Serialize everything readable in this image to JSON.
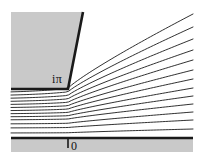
{
  "figure": {
    "name": "complex-strip-streamlines",
    "width": 204,
    "height": 162,
    "background": "#ffffff",
    "region_fill": "#c9c9c9",
    "stroke_color": "#1a1a1a",
    "thick_stroke_width": 2.6,
    "thin_stroke_width": 0.9
  },
  "labels": {
    "upper_boundary": "iπ",
    "lower_boundary": "0"
  },
  "geometry": {
    "panel": {
      "x": 11,
      "y": 12,
      "width": 182,
      "height": 140
    },
    "corner": {
      "x": 68,
      "y": 89
    },
    "upper_line_y": 89,
    "lower_line_y": 138,
    "wedge_angle_deg": 45,
    "tick": {
      "x": 68,
      "y_top": 138,
      "y_bottom": 148
    }
  },
  "chart_data": {
    "type": "line",
    "title": "",
    "xlabel": "",
    "ylabel": "",
    "boundaries": [
      {
        "name": "upper-boundary",
        "label": "iπ",
        "y_left": 89,
        "corner_x": 68,
        "slope_deg": 45
      },
      {
        "name": "lower-boundary",
        "label": "0",
        "y_left": 138,
        "y_right": 138
      }
    ],
    "streamline_count": 13,
    "streamlines": [
      {
        "index": 0,
        "y_left": 93,
        "y_right": 14
      },
      {
        "index": 1,
        "y_left": 96,
        "y_right": 27
      },
      {
        "index": 2,
        "y_left": 99,
        "y_right": 39
      },
      {
        "index": 3,
        "y_left": 102,
        "y_right": 50
      },
      {
        "index": 4,
        "y_left": 105,
        "y_right": 60
      },
      {
        "index": 5,
        "y_left": 108,
        "y_right": 70
      },
      {
        "index": 6,
        "y_left": 111,
        "y_right": 79
      },
      {
        "index": 7,
        "y_left": 114,
        "y_right": 88
      },
      {
        "index": 8,
        "y_left": 117,
        "y_right": 96
      },
      {
        "index": 9,
        "y_left": 120,
        "y_right": 104
      },
      {
        "index": 10,
        "y_left": 124,
        "y_right": 112
      },
      {
        "index": 11,
        "y_left": 128,
        "y_right": 120
      },
      {
        "index": 12,
        "y_left": 133,
        "y_right": 129
      }
    ]
  }
}
